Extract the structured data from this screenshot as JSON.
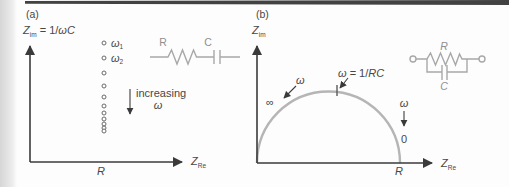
{
  "figure": {
    "panel_a": {
      "tag": "(a)",
      "ylabel": {
        "z": "Z",
        "sub": "im",
        "eq": " = 1/",
        "wc": "ωC"
      },
      "xlabel": {
        "z": "Z",
        "sub": "Re"
      },
      "axis_r": "R",
      "point_labels": [
        {
          "base": "ω",
          "sub": "1"
        },
        {
          "base": "ω",
          "sub": "2"
        }
      ],
      "annotation": {
        "line1": "increasing",
        "line2": "ω"
      },
      "circuit": {
        "r": "R",
        "c": "C"
      },
      "points_x": 104,
      "points_y": [
        43,
        58,
        73,
        86,
        97,
        106,
        113,
        119,
        124,
        128,
        131
      ]
    },
    "panel_b": {
      "tag": "(b)",
      "ylabel": {
        "z": "Z",
        "sub": "im"
      },
      "xlabel": {
        "z": "Z",
        "sub": "Re"
      },
      "axis_r": "R",
      "peak_label": {
        "w": "ω",
        "eq": " = 1/",
        "rc": "RC"
      },
      "omega_left": "ω",
      "infinity": "∞",
      "omega_right": "ω",
      "zero": "0",
      "circuit": {
        "r": "R",
        "c": "C"
      }
    },
    "colors": {
      "axis": "#3a3a3a",
      "curve": "#b5b5b5",
      "circuit": "#a8a8a8",
      "circuit_label": "#8f8f8f",
      "text": "#474747",
      "top_bar": "#424242",
      "left_strip": "#d6d6d6"
    }
  }
}
